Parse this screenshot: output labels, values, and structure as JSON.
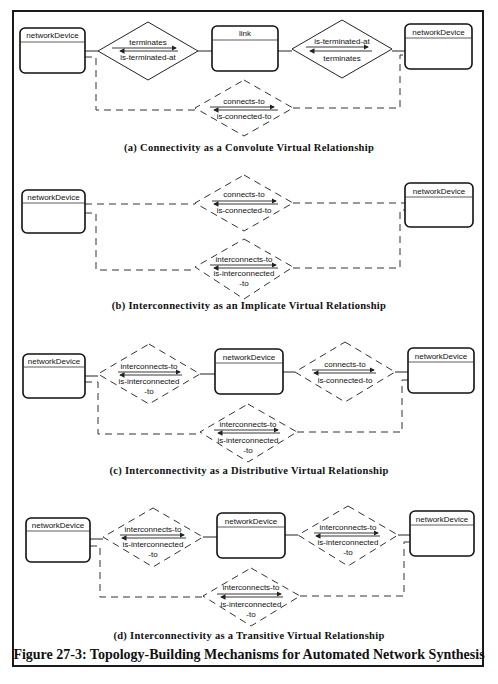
{
  "entities": {
    "network_device": "networkDevice",
    "link": "link"
  },
  "relationships": {
    "terminates": "terminates",
    "is_terminated_at": "is-terminated-at",
    "connects_to": "connects-to",
    "is_connected_to": "is-connected-to",
    "interconnects_to": "interconnects-to",
    "is_interconnected": "is-interconnected",
    "to_suffix": "-to"
  },
  "panels": [
    {
      "id": "a",
      "caption": "(a) Connectivity as a Convolute Virtual Relationship"
    },
    {
      "id": "b",
      "caption": "(b) Interconnectivity as an Implicate Virtual Relationship"
    },
    {
      "id": "c",
      "caption": "(c) Interconnectivity as a Distributive Virtual Relationship"
    },
    {
      "id": "d",
      "caption": "(d) Interconnectivity as a Transitive Virtual Relationship"
    }
  ],
  "figure_title": "Figure 27-3: Topology-Building Mechanisms for Automated Network Synthesis",
  "colors": {
    "line": "#222222",
    "background": "#ffffff"
  }
}
